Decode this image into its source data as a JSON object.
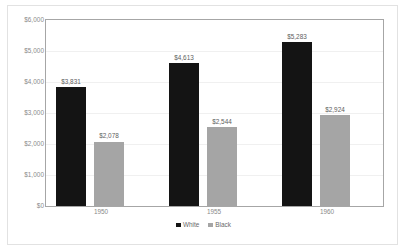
{
  "chart_data": {
    "type": "bar",
    "title": "",
    "subtitle": "",
    "xlabel": "",
    "ylabel": "",
    "categories": [
      "1950",
      "1955",
      "1960"
    ],
    "series": [
      {
        "name": "White",
        "color": "#141414",
        "values": [
          3831,
          4613,
          5283
        ],
        "labels": [
          "$3,831",
          "$4,613",
          "$5,283"
        ]
      },
      {
        "name": "Black",
        "color": "#a5a5a5",
        "values": [
          2078,
          2544,
          2924
        ],
        "labels": [
          "$2,078",
          "$2,544",
          "$2,924"
        ]
      }
    ],
    "ylim": [
      0,
      6000
    ],
    "ytick_values": [
      6000,
      5000,
      4000,
      3000,
      2000,
      1000,
      0
    ],
    "ytick_labels": [
      "$6,000",
      "$5,000",
      "$4,000",
      "$3,000",
      "$2,000",
      "$1,000",
      "$0"
    ],
    "grid": true,
    "grid_axis": "y",
    "legend_position": "bottom",
    "legend": [
      "White",
      "Black"
    ],
    "annotations": [
      "data labels shown above every bar"
    ],
    "colors": {
      "series_white": "#141414",
      "series_black": "#a5a5a5",
      "gridline": "#f0f0f0",
      "plot_border": "#a6a6a6",
      "figure_border": "#e2e2e2",
      "tick_text": "#8a8a8a",
      "label_text": "#5e5e5e",
      "background": "#ffffff"
    }
  }
}
